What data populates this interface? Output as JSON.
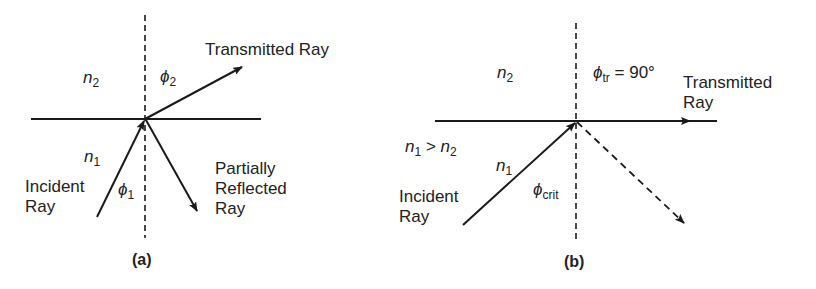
{
  "panel_a": {
    "caption": "(a)",
    "medium_top": {
      "symbol": "n",
      "sub": "2"
    },
    "medium_bottom": {
      "symbol": "n",
      "sub": "1"
    },
    "angle_transmitted": {
      "symbol": "ϕ",
      "sub": "2"
    },
    "angle_incident": {
      "symbol": "ϕ",
      "sub": "1"
    },
    "transmitted_label": "Transmitted Ray",
    "incident_label_1": "Incident",
    "incident_label_2": "Ray",
    "reflected_label_1": "Partially",
    "reflected_label_2": "Reflected",
    "reflected_label_3": "Ray"
  },
  "panel_b": {
    "caption": "(b)",
    "medium_top": {
      "symbol": "n",
      "sub": "2"
    },
    "medium_bottom": {
      "symbol": "n",
      "sub": "1"
    },
    "condition": {
      "a": "n",
      "a_sub": "1",
      "op": " > ",
      "b": "n",
      "b_sub": "2"
    },
    "angle_transmitted": {
      "symbol": "ϕ",
      "sub": "tr",
      "value": " = 90°"
    },
    "angle_critical": {
      "symbol": "ϕ",
      "sub": "crit"
    },
    "transmitted_label_1": "Transmitted",
    "transmitted_label_2": "Ray",
    "incident_label_1": "Incident",
    "incident_label_2": "Ray"
  },
  "colors": {
    "line": "#1a1a1a",
    "text": "#222222",
    "background": "#ffffff"
  }
}
